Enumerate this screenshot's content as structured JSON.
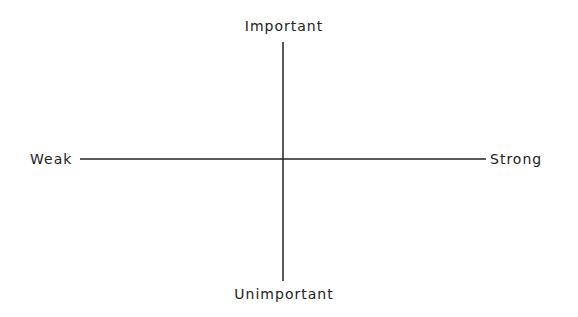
{
  "diagram": {
    "type": "quadrant-axes",
    "axes": {
      "vertical": {
        "top_label": "Important",
        "bottom_label": "Unimportant"
      },
      "horizontal": {
        "left_label": "Weak",
        "right_label": "Strong"
      }
    },
    "line_color": "#222222"
  }
}
